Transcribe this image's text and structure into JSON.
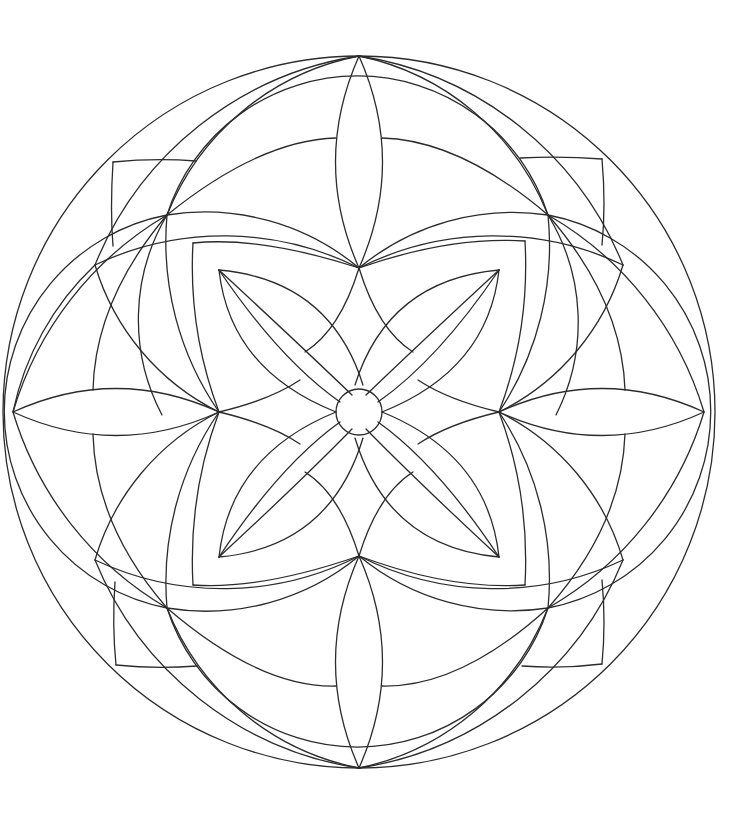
{
  "page": {
    "background": "#ffffff",
    "line_color": "#2b2b2b",
    "line_width": 1.3
  },
  "mandala": {
    "center": [
      359,
      412
    ],
    "outer_circle_radius": 356,
    "center_circle_radius": 23,
    "symmetry": "4-fold",
    "elements": [
      "outer-circle",
      "four-large-overlapping-circles",
      "cardinal-lens-petals",
      "corner-curved-squares",
      "rounded-square-frame",
      "inner-crossed-petals",
      "center-circle"
    ]
  }
}
